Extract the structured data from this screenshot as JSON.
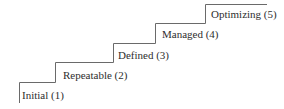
{
  "diagram": {
    "type": "staircase",
    "line_color": "#6a6a6a",
    "text_color": "#2e2e2e",
    "steps": [
      {
        "label": "Initial (1)",
        "level": 1
      },
      {
        "label": "Repeatable (2)",
        "level": 2
      },
      {
        "label": "Defined (3)",
        "level": 3
      },
      {
        "label": "Managed (4)",
        "level": 4
      },
      {
        "label": "Optimizing (5)",
        "level": 5
      }
    ]
  }
}
